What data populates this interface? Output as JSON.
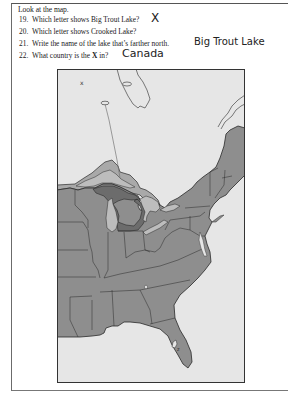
{
  "instructions": "Look at the map.",
  "questions": [
    {
      "number": "19.",
      "text": "Which letter shows Big Trout Lake?",
      "answer": "X"
    },
    {
      "number": "20.",
      "text": "Which letter shows Crooked Lake?",
      "answer": "Z"
    },
    {
      "number": "21.",
      "text": "Write the name of the lake that’s farther north.",
      "answer": "Big Trout Lake"
    },
    {
      "number": "22.",
      "text_before": "What country is the ",
      "text_bold": "X",
      "text_after": " in?",
      "answer": "Canada"
    }
  ],
  "map": {
    "markers": {
      "x_label": "x",
      "z_label": "z"
    },
    "colors": {
      "water": "#e6e6e6",
      "land": "#8e8e8e",
      "canada_land": "#a9a9a9",
      "michigan": "#6c6c6c",
      "lakes": "#bdbdbd",
      "border": "#2a2a2a"
    }
  }
}
